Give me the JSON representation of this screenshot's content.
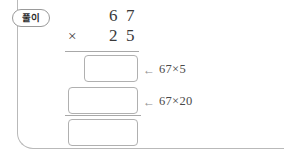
{
  "label": {
    "tag_text": "풀이",
    "tag_icon": "rounded-pill-tag"
  },
  "problem": {
    "multiplicand": {
      "tens": "6",
      "ones": "7"
    },
    "multiplier": {
      "operator": "×",
      "tens": "2",
      "ones": "5"
    }
  },
  "answer_boxes": [
    {
      "name": "partial-product-ones",
      "value": ""
    },
    {
      "name": "partial-product-tens",
      "value": ""
    },
    {
      "name": "total-product",
      "value": ""
    }
  ],
  "annotations": [
    {
      "arrow": "←",
      "text": "67×5"
    },
    {
      "arrow": "←",
      "text": "67×20"
    }
  ],
  "colors": {
    "ink": "#3a3a3a",
    "rule": "#a8a8a8",
    "box_border": "#b0b0b0",
    "frame": "#b9b9b9",
    "page": "#ffffff"
  }
}
